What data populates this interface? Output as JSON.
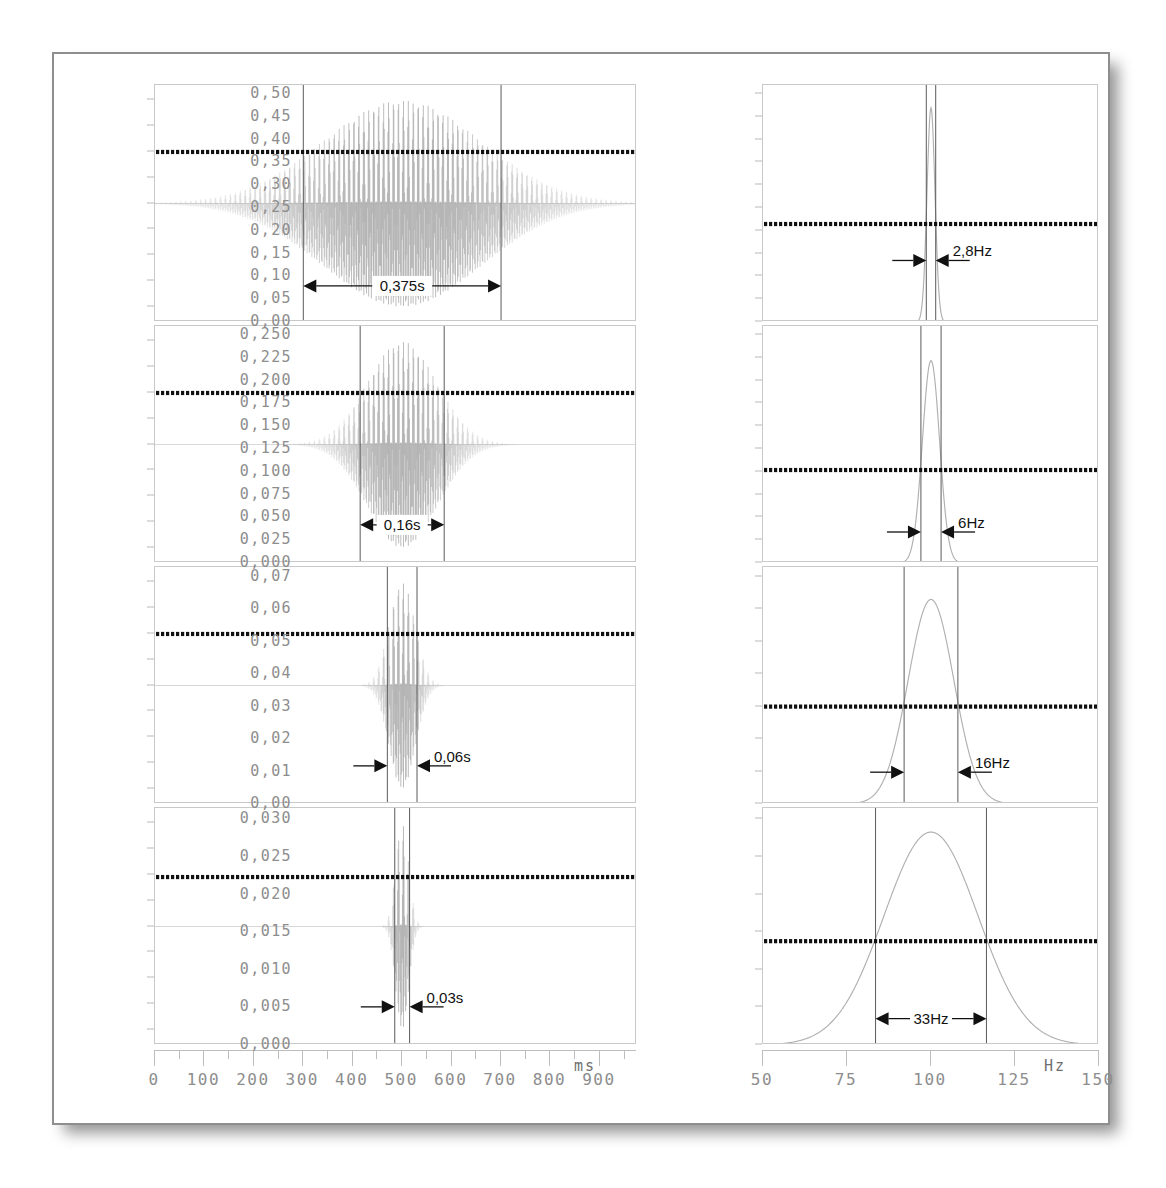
{
  "figure": {
    "frame_color": "#8e8e8e",
    "axis_color": "#c9c9c9",
    "tick_label_color": "#8d8d8d",
    "trace_color": "#b0b0b0",
    "marker_color": "#111111"
  },
  "time_axis": {
    "unit": "ms",
    "label_unit": "ms",
    "min": 0,
    "max": 975,
    "major_ticks": [
      0,
      100,
      200,
      300,
      400,
      500,
      600,
      700,
      800,
      900
    ],
    "tick_labels": [
      "0",
      "100",
      "200",
      "300",
      "400",
      "500",
      "600",
      "700",
      "800",
      "900"
    ],
    "minor_step": 50
  },
  "freq_axis": {
    "unit": "Hz",
    "label_unit": "Hz",
    "min": 50,
    "max": 150,
    "major_ticks": [
      50,
      75,
      100,
      125,
      150
    ],
    "tick_labels": [
      "50",
      "75",
      "100",
      "125",
      "150"
    ]
  },
  "chart_data": [
    {
      "id": "time-1",
      "type": "line",
      "panel": "row1-left",
      "title": "",
      "xlabel": "ms",
      "ylabel": "",
      "xlim": [
        0,
        975
      ],
      "ylim": [
        -1.15,
        1.15
      ],
      "yticks": [
        1.0,
        0.75,
        0.5,
        0.25,
        0.0,
        -0.25,
        -0.5,
        -0.75,
        -1.0
      ],
      "ytick_labels": [
        "1,00",
        "0,75",
        "0,50",
        "0,25",
        "0,00",
        "-0,25",
        "-0,50",
        "-0,75",
        "-1,00"
      ],
      "signal": {
        "kind": "gaussian-windowed-sine",
        "carrier_hz": 100,
        "center_ms": 500,
        "envelope_sigma_ms": 160,
        "amplitude": 1.0
      },
      "marker_line": {
        "value": 0.5,
        "style": "dotted-thick",
        "color": "#111111"
      },
      "annotation": {
        "label": "0,375s",
        "x_from_ms": 300,
        "x_to_ms": 700,
        "arrow_style": "double-outward",
        "y_level": -0.8
      },
      "span_lines_ms": [
        300,
        700
      ]
    },
    {
      "id": "time-2",
      "type": "line",
      "panel": "row2-left",
      "xlim": [
        0,
        975
      ],
      "ylim": [
        -1.15,
        1.15
      ],
      "yticks": [
        1.0,
        0.75,
        0.5,
        0.25,
        0.0,
        -0.25,
        -0.5,
        -0.75,
        -1.0
      ],
      "ytick_labels": [
        "1,00",
        "0,75",
        "0,50",
        "0,25",
        "0,00",
        "-0,25",
        "-0,50",
        "-0,75",
        "-1,00"
      ],
      "signal": {
        "kind": "gaussian-windowed-sine",
        "carrier_hz": 100,
        "center_ms": 500,
        "envelope_sigma_ms": 70,
        "amplitude": 1.0
      },
      "marker_line": {
        "value": 0.5,
        "style": "dotted-thick",
        "color": "#111111"
      },
      "annotation": {
        "label": "0,16s",
        "x_from_ms": 415,
        "x_to_ms": 585,
        "arrow_style": "double-outward",
        "y_level": -0.78
      },
      "span_lines_ms": [
        415,
        585
      ]
    },
    {
      "id": "time-3",
      "type": "line",
      "panel": "row3-left",
      "xlim": [
        0,
        975
      ],
      "ylim": [
        -1.15,
        1.15
      ],
      "yticks": [
        1.0,
        0.75,
        0.5,
        0.25,
        0.0,
        -0.25,
        -0.5,
        -0.75,
        -1.0
      ],
      "ytick_labels": [
        "1,00",
        "0,75",
        "0,50",
        "0,25",
        "0,00",
        "-0,25",
        "-0,50",
        "-0,75",
        "-1,00"
      ],
      "signal": {
        "kind": "gaussian-windowed-sine",
        "carrier_hz": 100,
        "center_ms": 500,
        "envelope_sigma_ms": 26,
        "amplitude": 1.0
      },
      "marker_line": {
        "value": 0.5,
        "style": "dotted-thick",
        "color": "#111111"
      },
      "annotation": {
        "label": "0,06s",
        "x_from_ms": 470,
        "x_to_ms": 530,
        "arrow_style": "double-inward",
        "y_level": -0.78
      },
      "span_lines_ms": [
        470,
        530
      ]
    },
    {
      "id": "time-4",
      "type": "line",
      "panel": "row4-left",
      "xlim": [
        0,
        975
      ],
      "ylim": [
        -1.15,
        1.15
      ],
      "yticks": [
        1.0,
        0.75,
        0.5,
        0.25,
        0.0,
        -0.25,
        -0.5,
        -0.75,
        -1.0
      ],
      "ytick_labels": [
        "1,00",
        "0,75",
        "0,50",
        "0,25",
        "0,00",
        "-0,25",
        "-0,50",
        "-0,75",
        "-1,00"
      ],
      "signal": {
        "kind": "gaussian-windowed-sine",
        "carrier_hz": 100,
        "center_ms": 500,
        "envelope_sigma_ms": 13,
        "amplitude": 1.0
      },
      "marker_line": {
        "value": 0.48,
        "style": "dotted-thick",
        "color": "#111111"
      },
      "annotation": {
        "label": "0,03s",
        "x_from_ms": 485,
        "x_to_ms": 515,
        "arrow_style": "double-inward",
        "y_level": -0.78
      },
      "span_lines_ms": [
        485,
        515
      ]
    },
    {
      "id": "freq-1",
      "type": "line",
      "panel": "row1-right",
      "xlabel": "Hz",
      "xlim": [
        50,
        150
      ],
      "ylim": [
        0.0,
        0.52
      ],
      "yticks": [
        0.5,
        0.45,
        0.4,
        0.35,
        0.3,
        0.25,
        0.2,
        0.15,
        0.1,
        0.05,
        0.0
      ],
      "ytick_labels": [
        "0,50",
        "0,45",
        "0,40",
        "0,35",
        "0,30",
        "0,25",
        "0,20",
        "0,15",
        "0,10",
        "0,05",
        "0,00"
      ],
      "spectrum": {
        "kind": "gaussian-peak",
        "center_hz": 100,
        "fwhm_hz": 2.8,
        "peak_value": 0.47
      },
      "marker_line": {
        "value": 0.215,
        "style": "dotted-thick",
        "color": "#111111"
      },
      "annotation": {
        "label": "2,8Hz",
        "x_from_hz": 98.6,
        "x_to_hz": 101.4,
        "arrow_style": "double-inward",
        "y_level": 0.135
      },
      "span_lines_hz": [
        98.6,
        101.4
      ]
    },
    {
      "id": "freq-2",
      "type": "line",
      "panel": "row2-right",
      "xlim": [
        50,
        150
      ],
      "ylim": [
        0.0,
        0.26
      ],
      "yticks": [
        0.25,
        0.225,
        0.2,
        0.175,
        0.15,
        0.125,
        0.1,
        0.075,
        0.05,
        0.025,
        0.0
      ],
      "ytick_labels": [
        "0,250",
        "0,225",
        "0,200",
        "0,175",
        "0,150",
        "0,125",
        "0,100",
        "0,075",
        "0,050",
        "0,025",
        "0,000"
      ],
      "spectrum": {
        "kind": "gaussian-peak",
        "center_hz": 100,
        "fwhm_hz": 6,
        "peak_value": 0.222
      },
      "marker_line": {
        "value": 0.102,
        "style": "dotted-thick",
        "color": "#111111"
      },
      "annotation": {
        "label": "6Hz",
        "x_from_hz": 97,
        "x_to_hz": 103,
        "arrow_style": "double-inward",
        "y_level": 0.034
      },
      "span_lines_hz": [
        97,
        103
      ]
    },
    {
      "id": "freq-3",
      "type": "line",
      "panel": "row3-right",
      "xlim": [
        50,
        150
      ],
      "ylim": [
        0.0,
        0.073
      ],
      "yticks": [
        0.07,
        0.06,
        0.05,
        0.04,
        0.03,
        0.02,
        0.01,
        0.0
      ],
      "ytick_labels": [
        "0,07",
        "0,06",
        "0,05",
        "0,04",
        "0,03",
        "0,02",
        "0,01",
        "0,00"
      ],
      "spectrum": {
        "kind": "gaussian-peak",
        "center_hz": 100,
        "fwhm_hz": 16,
        "peak_value": 0.063
      },
      "marker_line": {
        "value": 0.03,
        "style": "dotted-thick",
        "color": "#111111"
      },
      "annotation": {
        "label": "16Hz",
        "x_from_hz": 92,
        "x_to_hz": 108,
        "arrow_style": "double-inward",
        "y_level": 0.0098
      },
      "span_lines_hz": [
        92,
        108
      ]
    },
    {
      "id": "freq-4",
      "type": "line",
      "panel": "row4-right",
      "xlim": [
        50,
        150
      ],
      "ylim": [
        0.0,
        0.0315
      ],
      "yticks": [
        0.03,
        0.025,
        0.02,
        0.015,
        0.01,
        0.005,
        0.0
      ],
      "ytick_labels": [
        "0,030",
        "0,025",
        "0,020",
        "0,015",
        "0,010",
        "0,005",
        "0,000"
      ],
      "spectrum": {
        "kind": "gaussian-peak",
        "center_hz": 100,
        "fwhm_hz": 33,
        "peak_value": 0.0283
      },
      "marker_line": {
        "value": 0.0138,
        "style": "dotted-thick",
        "color": "#111111"
      },
      "annotation": {
        "label": "33Hz",
        "x_from_hz": 83.5,
        "x_to_hz": 116.5,
        "arrow_style": "double-outward",
        "y_level": 0.0035
      },
      "span_lines_hz": [
        83.5,
        116.5
      ]
    }
  ]
}
